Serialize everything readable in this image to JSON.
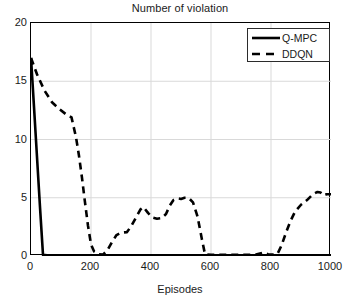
{
  "chart_data": {
    "type": "line",
    "title": "Number of violation",
    "xlabel": "Episodes",
    "ylabel": "",
    "xlim": [
      0,
      1000
    ],
    "ylim": [
      0,
      20
    ],
    "xticks": [
      0,
      200,
      400,
      600,
      800,
      1000
    ],
    "yticks": [
      0,
      5,
      10,
      15,
      20
    ],
    "grid": true,
    "legend_position": "top-right",
    "series": [
      {
        "name": "Q-MPC",
        "style": "solid",
        "color": "#000000",
        "x": [
          0,
          10,
          20,
          30,
          40,
          60,
          100,
          200,
          300,
          400,
          500,
          600,
          700,
          800,
          900,
          1000
        ],
        "y": [
          17,
          12.8,
          8.5,
          4.2,
          0.1,
          0.05,
          0.05,
          0.05,
          0.05,
          0.05,
          0.05,
          0.05,
          0.05,
          0.05,
          0.05,
          0.05
        ]
      },
      {
        "name": "DDQN",
        "style": "dashed",
        "color": "#000000",
        "x": [
          0,
          20,
          45,
          70,
          95,
          115,
          135,
          150,
          160,
          170,
          180,
          190,
          200,
          210,
          225,
          240,
          255,
          270,
          285,
          300,
          320,
          335,
          350,
          365,
          375,
          390,
          405,
          420,
          435,
          450,
          462,
          475,
          488,
          500,
          512,
          525,
          540,
          555,
          570,
          580,
          600,
          650,
          700,
          750,
          775,
          790,
          800,
          812,
          822,
          835,
          850,
          865,
          880,
          900,
          920,
          940,
          955,
          965,
          975,
          985,
          1000
        ],
        "y": [
          17,
          15.6,
          14.2,
          13.2,
          12.6,
          12.2,
          11.9,
          10.2,
          8.6,
          6.7,
          4.6,
          2.6,
          1.0,
          0.4,
          0.15,
          0.12,
          0.5,
          1.2,
          1.8,
          2.0,
          2.05,
          2.6,
          3.3,
          4.0,
          4.2,
          3.7,
          3.3,
          3.2,
          3.25,
          3.6,
          4.3,
          4.8,
          4.95,
          4.9,
          5.0,
          5.0,
          4.6,
          3.4,
          1.4,
          0.15,
          0.1,
          0.1,
          0.1,
          0.12,
          0.3,
          0.15,
          0.12,
          0.12,
          0.2,
          0.9,
          2.0,
          3.0,
          3.8,
          4.4,
          4.8,
          5.3,
          5.5,
          5.45,
          5.2,
          5.3,
          5.3
        ]
      }
    ]
  },
  "legend": {
    "items": [
      {
        "label": "Q-MPC",
        "style": "solid"
      },
      {
        "label": "DDQN",
        "style": "dashed"
      }
    ]
  }
}
